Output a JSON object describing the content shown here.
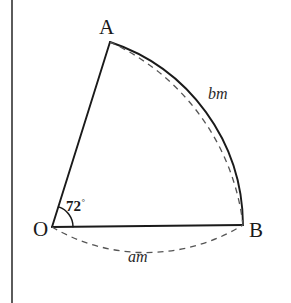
{
  "figure": {
    "background_color": "#ffffff",
    "stroke_color": "#1a1a1a",
    "dashed_stroke_color": "#555555",
    "border": {
      "name": "left-page-border",
      "orientation": "vertical",
      "x": 12,
      "color": "#333333"
    },
    "points": {
      "O": {
        "label": "O",
        "x": 52,
        "y": 227
      },
      "A": {
        "label": "A",
        "x": 110,
        "y": 42
      },
      "B": {
        "label": "B",
        "x": 243,
        "y": 225
      }
    },
    "angle": {
      "at": "O",
      "value": "72",
      "degree_symbol": "°",
      "arc_radius": 21
    },
    "arcs": {
      "solid_arc_AB": {
        "from": "A",
        "to": "B",
        "style": "solid",
        "description": "sector arc from A to B"
      },
      "dashed_arc_AB": {
        "from": "A",
        "to": "B",
        "style": "dashed",
        "label": "bm",
        "description": "dashed arc bulging outside the solid arc AB"
      },
      "dashed_arc_OB": {
        "from": "O",
        "to": "B",
        "style": "dashed",
        "label": "am",
        "description": "dashed arc bulging below chord OB"
      }
    },
    "segments": {
      "OA": {
        "from": "O",
        "to": "A",
        "style": "solid"
      },
      "OB": {
        "from": "O",
        "to": "B",
        "style": "solid"
      }
    },
    "labels": {
      "A": "A",
      "O": "O",
      "B": "B",
      "bm": "bm",
      "am": "am"
    }
  }
}
